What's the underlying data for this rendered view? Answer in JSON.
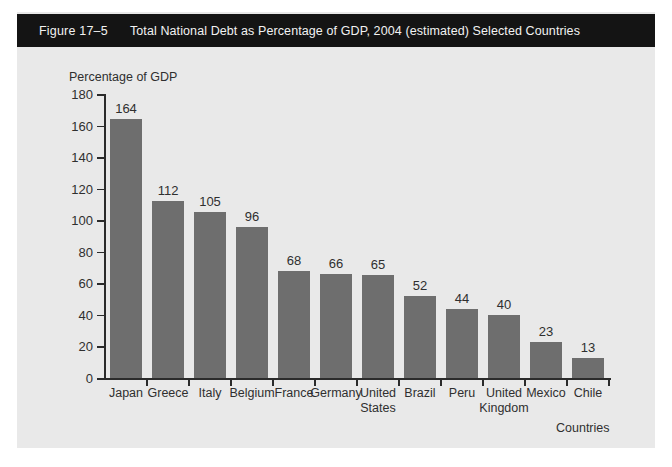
{
  "figure": {
    "number": "Figure 17–5",
    "title": "Total National Debt as Percentage of GDP, 2004 (estimated) Selected Countries",
    "caption_bar_color": "#141414",
    "panel_color": "#e9e9e9",
    "bar_color": "#6e6e6e",
    "axis_color": "#2b2b2b",
    "text_color": "#2f2f2f"
  },
  "chart_data": {
    "type": "bar",
    "title": "Total National Debt as Percentage of GDP, 2004 (estimated) Selected Countries",
    "xlabel": "Countries",
    "ylabel": "Percentage of GDP",
    "categories": [
      "Japan",
      "Greece",
      "Italy",
      "Belgium",
      "France",
      "Germany",
      "United States",
      "Brazil",
      "Peru",
      "United Kingdom",
      "Mexico",
      "Chile"
    ],
    "category_lines": [
      [
        "Japan"
      ],
      [
        "Greece"
      ],
      [
        "Italy"
      ],
      [
        "Belgium"
      ],
      [
        "France"
      ],
      [
        "Germany"
      ],
      [
        "United",
        "States"
      ],
      [
        "Brazil"
      ],
      [
        "Peru"
      ],
      [
        "United",
        "Kingdom"
      ],
      [
        "Mexico"
      ],
      [
        "Chile"
      ]
    ],
    "values": [
      164,
      112,
      105,
      96,
      68,
      66,
      65,
      52,
      44,
      40,
      23,
      13
    ],
    "value_labels": [
      "164",
      "112",
      "105",
      "96",
      "68",
      "66",
      "65",
      "52",
      "44",
      "40",
      "23",
      "13"
    ],
    "ylim": [
      0,
      180
    ],
    "yticks": [
      0,
      20,
      40,
      60,
      80,
      100,
      120,
      140,
      160,
      180
    ],
    "ytick_labels": [
      "0",
      "20",
      "40",
      "60",
      "80",
      "100",
      "120",
      "140",
      "160",
      "180"
    ],
    "grid": false,
    "legend": null
  }
}
